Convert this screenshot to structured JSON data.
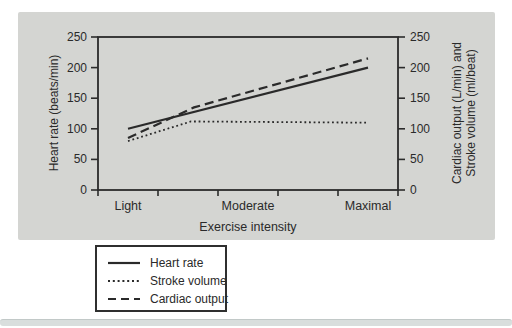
{
  "chart_data": {
    "type": "line",
    "title": "",
    "xlabel": "Exercise intensity",
    "ylabel_left": "Heart rate (beats/min)",
    "ylabel_right": "Cardiac output (L/min) and Stroke volume (ml/beat)",
    "ylabel_right_lines": [
      "Cardiac output (L/min) and",
      "Stroke volume (ml/beat)"
    ],
    "x_categories": [
      "Light",
      "Moderate",
      "Maximal"
    ],
    "x_category_fractions": [
      0.1,
      0.5,
      0.9
    ],
    "ylim": [
      0,
      250
    ],
    "yticks": [
      0,
      50,
      100,
      150,
      200,
      250
    ],
    "yticks_right": [
      0,
      50,
      100,
      150,
      200,
      250
    ],
    "grid": false,
    "legend_position": "below-left",
    "series": [
      {
        "name": "Heart rate",
        "style": "solid",
        "points": [
          {
            "x": 0.1,
            "y": 100
          },
          {
            "x": 0.9,
            "y": 200
          }
        ]
      },
      {
        "name": "Stroke volume",
        "style": "dotted",
        "points": [
          {
            "x": 0.1,
            "y": 80
          },
          {
            "x": 0.31,
            "y": 112
          },
          {
            "x": 0.9,
            "y": 110
          }
        ]
      },
      {
        "name": "Cardiac output",
        "style": "dashed",
        "points": [
          {
            "x": 0.1,
            "y": 85
          },
          {
            "x": 0.32,
            "y": 135
          },
          {
            "x": 0.9,
            "y": 215
          }
        ]
      }
    ],
    "colors": {
      "line": "#2a2a2a",
      "axis": "#2b2b2b",
      "panel_bg": "#d4d5d2",
      "text": "#2a2a2a",
      "page_edge": "#d9dedd"
    }
  }
}
